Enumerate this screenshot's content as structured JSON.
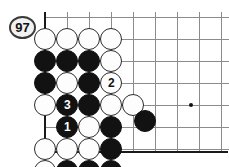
{
  "figure": {
    "name": "go-board-diagram",
    "board_background": "#ffffff",
    "line_color": "#8c8c8c",
    "edge_color": "#1a1a1a",
    "black_color": "#121212",
    "white_color": "#fdfdfd"
  },
  "move_marker": {
    "label": "97",
    "color": "#f2f2f2"
  },
  "grid": {
    "columns_x": [
      45,
      67,
      89,
      111,
      133,
      155,
      177,
      199,
      221
    ],
    "rows_y": [
      17,
      39,
      61,
      83,
      105,
      127,
      149
    ],
    "left_edge_x": 45,
    "bottom_edge_y": 151,
    "star_points": [
      {
        "x": 191,
        "y": 105
      }
    ]
  },
  "stones": [
    {
      "id": "w-r1-c1",
      "color": "white",
      "x": 45,
      "y": 39,
      "label": ""
    },
    {
      "id": "w-r1-c2",
      "color": "white",
      "x": 67,
      "y": 39,
      "label": ""
    },
    {
      "id": "w-r1-c3",
      "color": "white",
      "x": 89,
      "y": 39,
      "label": ""
    },
    {
      "id": "w-r1-c4",
      "color": "white",
      "x": 111,
      "y": 39,
      "label": ""
    },
    {
      "id": "b-r2-c1",
      "color": "black",
      "x": 45,
      "y": 61,
      "label": ""
    },
    {
      "id": "b-r2-c2",
      "color": "black",
      "x": 67,
      "y": 61,
      "label": ""
    },
    {
      "id": "b-r2-c3",
      "color": "black",
      "x": 89,
      "y": 61,
      "label": ""
    },
    {
      "id": "w-r2-c4",
      "color": "white",
      "x": 111,
      "y": 61,
      "label": ""
    },
    {
      "id": "b-r3-c1",
      "color": "black",
      "x": 45,
      "y": 83,
      "label": ""
    },
    {
      "id": "w-r3-c2",
      "color": "white",
      "x": 67,
      "y": 83,
      "label": ""
    },
    {
      "id": "b-r3-c3",
      "color": "black",
      "x": 89,
      "y": 83,
      "label": ""
    },
    {
      "id": "w-move-2",
      "color": "white",
      "x": 111,
      "y": 83,
      "label": "2"
    },
    {
      "id": "w-r4-c1",
      "color": "white",
      "x": 45,
      "y": 105,
      "label": ""
    },
    {
      "id": "b-move-3",
      "color": "black",
      "x": 67,
      "y": 105,
      "label": "3"
    },
    {
      "id": "b-r4-c3",
      "color": "black",
      "x": 89,
      "y": 105,
      "label": ""
    },
    {
      "id": "w-r4-c4",
      "color": "white",
      "x": 111,
      "y": 105,
      "label": ""
    },
    {
      "id": "w-r4-c5",
      "color": "white",
      "x": 133,
      "y": 105,
      "label": ""
    },
    {
      "id": "b-move-1",
      "color": "black",
      "x": 67,
      "y": 127,
      "label": "1"
    },
    {
      "id": "w-r5-c3",
      "color": "white",
      "x": 89,
      "y": 127,
      "label": ""
    },
    {
      "id": "b-r5-c4",
      "color": "black",
      "x": 111,
      "y": 127,
      "label": ""
    },
    {
      "id": "w-r6-c1",
      "color": "white",
      "x": 45,
      "y": 149,
      "label": ""
    },
    {
      "id": "w-r6-c2",
      "color": "white",
      "x": 67,
      "y": 149,
      "label": ""
    },
    {
      "id": "w-r6-c3",
      "color": "white",
      "x": 89,
      "y": 149,
      "label": ""
    },
    {
      "id": "b-r6-c4",
      "color": "black",
      "x": 111,
      "y": 149,
      "label": ""
    },
    {
      "id": "w-r7-c1",
      "color": "white",
      "x": 45,
      "y": 171,
      "label": ""
    },
    {
      "id": "b-r7-c2",
      "color": "black",
      "x": 67,
      "y": 171,
      "label": ""
    },
    {
      "id": "b-r7-c3",
      "color": "black",
      "x": 89,
      "y": 171,
      "label": ""
    },
    {
      "id": "b-r7-c4",
      "color": "black",
      "x": 111,
      "y": 171,
      "label": ""
    },
    {
      "id": "b-free-stone",
      "color": "black",
      "x": 145,
      "y": 121,
      "label": ""
    }
  ]
}
